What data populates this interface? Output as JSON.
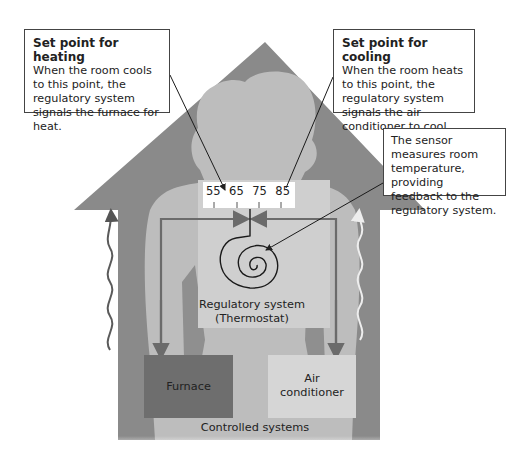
{
  "callouts": {
    "heating": {
      "title": "Set point for heating",
      "body": "When the room cools to this point, the regulatory system signals the furnace for heat."
    },
    "cooling": {
      "title": "Set point for cooling",
      "body": "When the room heats to this point, the regulatory system signals the air conditioner to cool."
    },
    "sensor": {
      "body": "The sensor measures room temperature, providing feedback to the regulatory system."
    }
  },
  "thermostat": {
    "scale": [
      "55",
      "65",
      "75",
      "85"
    ],
    "label_line1": "Regulatory system",
    "label_line2": "(Thermostat)"
  },
  "controlled": {
    "furnace": "Furnace",
    "ac_line1": "Air",
    "ac_line2": "conditioner",
    "label": "Controlled systems"
  },
  "colors": {
    "house": "#8a8a8a",
    "body": "#bdbdbd",
    "panel": "#cfcfcf",
    "furnace": "#6e6e6e",
    "ac": "#d6d6d6",
    "arrow": "#6b6b6b",
    "heat_wave": "#6b6b6b",
    "cool_wave": "#e8e8e8"
  }
}
